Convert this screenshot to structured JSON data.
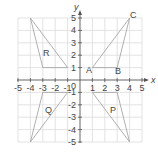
{
  "diagram": {
    "type": "coordinate-grid",
    "axes": {
      "x_label": "x",
      "y_label": "y",
      "origin_label": "0",
      "x_range": [
        -5,
        5
      ],
      "y_range": [
        -5,
        5
      ],
      "x_ticks": [
        "-5",
        "-4",
        "-3",
        "-2",
        "-1",
        "1",
        "2",
        "3",
        "4",
        "5"
      ],
      "y_ticks": [
        "5",
        "4",
        "3",
        "2",
        "1",
        "-1",
        "-2",
        "-3",
        "-4",
        "-5"
      ]
    },
    "triangles": [
      {
        "name": "ABC",
        "label": "",
        "vertices": [
          [
            1,
            1
          ],
          [
            3,
            1
          ],
          [
            4,
            5
          ]
        ],
        "vertex_labels": [
          "A",
          "B",
          "C"
        ]
      },
      {
        "name": "R",
        "label": "R",
        "vertices": [
          [
            -4,
            5
          ],
          [
            -3,
            1
          ],
          [
            -1,
            1
          ]
        ]
      },
      {
        "name": "Q",
        "label": "Q",
        "vertices": [
          [
            -4,
            -5
          ],
          [
            -3,
            -1
          ],
          [
            -1,
            -1
          ]
        ]
      },
      {
        "name": "P",
        "label": "P",
        "vertices": [
          [
            1,
            -1
          ],
          [
            3,
            -1
          ],
          [
            4,
            -5
          ]
        ]
      }
    ],
    "colors": {
      "grid": "#dcdcdc",
      "axis": "#555555",
      "triangle": "#a8a8a8",
      "text": "#444444"
    }
  }
}
